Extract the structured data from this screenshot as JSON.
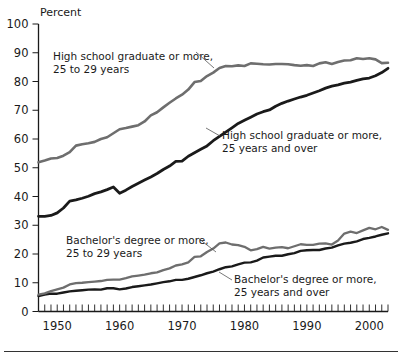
{
  "chart_data": {
    "type": "line",
    "title": "",
    "subtitle": "",
    "xlabel": "",
    "ylabel": "Percent",
    "ylim": [
      0,
      100
    ],
    "xlim": [
      1947,
      2003
    ],
    "grid": false,
    "legend_position": "inline-annotations",
    "ytick_labels": [
      "0",
      "10",
      "20",
      "30",
      "40",
      "50",
      "60",
      "70",
      "80",
      "90",
      "100"
    ],
    "ytick_values": [
      0,
      10,
      20,
      30,
      40,
      50,
      60,
      70,
      80,
      90,
      100
    ],
    "xtick_labels": [
      "1950",
      "1960",
      "1970",
      "1980",
      "1990",
      "2000"
    ],
    "xtick_values": [
      1950,
      1960,
      1970,
      1980,
      1990,
      2000
    ],
    "x_minor_tick_interval": 1,
    "annotations": [
      {
        "id": "hs-25-29",
        "line1": "High school graduate or more,",
        "line2": "25 to 29 years"
      },
      {
        "id": "hs-25-over",
        "line1": "High school graduate or more,",
        "line2": "25 years and over"
      },
      {
        "id": "ba-25-29",
        "line1": "Bachelor's degree or more,",
        "line2": "25 to 29 years"
      },
      {
        "id": "ba-25-over",
        "line1": "Bachelor's degree or more,",
        "line2": "25 years and over"
      }
    ],
    "x": [
      1947,
      1948,
      1949,
      1950,
      1951,
      1952,
      1953,
      1954,
      1955,
      1956,
      1957,
      1958,
      1959,
      1960,
      1961,
      1962,
      1963,
      1964,
      1965,
      1966,
      1967,
      1968,
      1969,
      1970,
      1971,
      1972,
      1973,
      1974,
      1975,
      1976,
      1977,
      1978,
      1979,
      1980,
      1981,
      1982,
      1983,
      1984,
      1985,
      1986,
      1987,
      1988,
      1989,
      1990,
      1991,
      1992,
      1993,
      1994,
      1995,
      1996,
      1997,
      1998,
      1999,
      2000,
      2001,
      2002,
      2003
    ],
    "series": [
      {
        "name": "High school graduate or more, 25 to 29 years",
        "color": "#6e6e6e",
        "linewidth": 2.6,
        "values": [
          51.9,
          52.5,
          53.2,
          53.4,
          54.2,
          55.4,
          57.7,
          58.2,
          58.5,
          59.0,
          60.0,
          60.6,
          62.0,
          63.4,
          63.8,
          64.3,
          64.8,
          66.1,
          68.2,
          69.3,
          71.0,
          72.6,
          74.1,
          75.4,
          77.2,
          79.8,
          80.2,
          81.9,
          83.1,
          84.7,
          85.4,
          85.3,
          85.6,
          85.4,
          86.3,
          86.2,
          86.0,
          85.9,
          86.1,
          86.1,
          86.0,
          85.7,
          85.5,
          85.7,
          85.4,
          86.3,
          86.7,
          86.1,
          86.8,
          87.3,
          87.4,
          88.1,
          87.8,
          88.1,
          87.7,
          86.4,
          86.5
        ]
      },
      {
        "name": "High school graduate or more, 25 years and over",
        "color": "#1a1a1a",
        "linewidth": 2.8,
        "values": [
          33.1,
          33.1,
          33.4,
          34.3,
          36.0,
          38.4,
          38.8,
          39.4,
          40.1,
          41.0,
          41.6,
          42.4,
          43.3,
          41.1,
          42.2,
          43.5,
          44.6,
          45.7,
          46.8,
          48.0,
          49.4,
          50.6,
          52.2,
          52.3,
          54.0,
          55.2,
          56.4,
          57.6,
          59.4,
          60.9,
          62.4,
          63.9,
          65.4,
          66.5,
          67.6,
          68.7,
          69.5,
          70.1,
          71.4,
          72.4,
          73.2,
          73.9,
          74.6,
          75.2,
          76.0,
          76.8,
          77.7,
          78.4,
          78.8,
          79.4,
          79.8,
          80.4,
          80.9,
          81.2,
          82.0,
          83.1,
          84.6
        ]
      },
      {
        "name": "Bachelor's degree or more, 25 to 29 years",
        "color": "#6e6e6e",
        "linewidth": 2.3,
        "values": [
          5.9,
          6.3,
          7.1,
          7.7,
          8.3,
          9.4,
          9.9,
          10.0,
          10.2,
          10.4,
          10.6,
          11.0,
          11.1,
          11.1,
          11.6,
          12.2,
          12.5,
          12.8,
          13.3,
          13.6,
          14.4,
          15.0,
          16.0,
          16.4,
          17.1,
          19.0,
          19.2,
          20.7,
          21.9,
          23.7,
          24.0,
          23.3,
          23.1,
          22.5,
          21.3,
          21.7,
          22.5,
          21.9,
          22.2,
          22.4,
          22.0,
          22.7,
          23.4,
          23.2,
          23.2,
          23.6,
          23.7,
          23.3,
          24.7,
          27.1,
          27.8,
          27.3,
          28.2,
          29.1,
          28.6,
          29.4,
          28.4
        ]
      },
      {
        "name": "Bachelor's degree or more, 25 years and over",
        "color": "#1a1a1a",
        "linewidth": 2.4,
        "values": [
          5.4,
          5.9,
          6.2,
          6.2,
          6.6,
          7.0,
          7.2,
          7.4,
          7.6,
          7.7,
          7.6,
          8.1,
          8.1,
          7.7,
          8.0,
          8.5,
          8.8,
          9.1,
          9.4,
          9.8,
          10.2,
          10.5,
          11.0,
          11.0,
          11.4,
          12.0,
          12.6,
          13.3,
          13.9,
          14.7,
          15.4,
          15.7,
          16.4,
          17.0,
          17.1,
          17.7,
          18.8,
          19.1,
          19.4,
          19.4,
          19.9,
          20.3,
          21.1,
          21.3,
          21.4,
          21.4,
          21.9,
          22.2,
          23.0,
          23.6,
          23.9,
          24.4,
          25.2,
          25.6,
          26.1,
          26.7,
          27.2
        ]
      }
    ]
  }
}
